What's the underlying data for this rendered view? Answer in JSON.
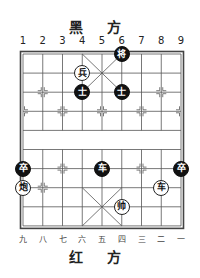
{
  "board": {
    "top_side_label": "黑 方",
    "bottom_side_label": "红 方",
    "top_column_labels": [
      "1",
      "2",
      "3",
      "4",
      "5",
      "6",
      "7",
      "8",
      "9"
    ],
    "bottom_column_labels": [
      "九",
      "八",
      "七",
      "六",
      "五",
      "四",
      "三",
      "二",
      "一"
    ],
    "files": 9,
    "ranks": 10,
    "river_text": ""
  },
  "pieces": [
    {
      "side": "black",
      "char": "将",
      "name": "black-general",
      "col": 6,
      "row": 1
    },
    {
      "side": "red",
      "char": "兵",
      "name": "red-soldier",
      "col": 4,
      "row": 2
    },
    {
      "side": "black",
      "char": "士",
      "name": "black-advisor",
      "col": 4,
      "row": 3
    },
    {
      "side": "black",
      "char": "士",
      "name": "black-advisor",
      "col": 6,
      "row": 3
    },
    {
      "side": "black",
      "char": "卒",
      "name": "black-soldier",
      "col": 1,
      "row": 7
    },
    {
      "side": "black",
      "char": "车",
      "name": "black-chariot",
      "col": 5,
      "row": 7
    },
    {
      "side": "black",
      "char": "卒",
      "name": "black-soldier",
      "col": 9,
      "row": 7
    },
    {
      "side": "red",
      "char": "炮",
      "name": "red-cannon",
      "col": 1,
      "row": 8
    },
    {
      "side": "red",
      "char": "车",
      "name": "red-chariot",
      "col": 8,
      "row": 8
    },
    {
      "side": "red",
      "char": "帅",
      "name": "red-general",
      "col": 6,
      "row": 9
    }
  ],
  "colors": {
    "black_piece": "#111111",
    "red_piece_fill": "#ffffff",
    "line": "#555555"
  }
}
